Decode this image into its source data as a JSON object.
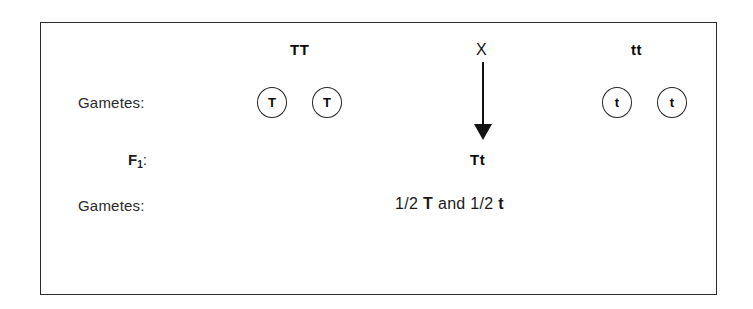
{
  "diagram": {
    "border_color": "#2b2b2b",
    "text_color": "#111111"
  },
  "rows": {
    "parents_label": "",
    "gametes_label_1": "Gametes:",
    "f1_label_f": "F",
    "f1_label_sub": "1",
    "f1_label_colon": ":",
    "gametes_label_2": "Gametes:"
  },
  "parents": {
    "left_genotype": "TT",
    "cross_symbol": "X",
    "right_genotype": "tt"
  },
  "gametes_parent_left": [
    {
      "allele": "T"
    },
    {
      "allele": "T"
    }
  ],
  "gametes_parent_right": [
    {
      "allele": "t"
    },
    {
      "allele": "t"
    }
  ],
  "offspring": {
    "f1_genotype": "Tt"
  },
  "f1_gametes": {
    "fraction_1": "1/2",
    "allele_1": "T",
    "conjunction": "and",
    "fraction_2": "1/2",
    "allele_2": "t"
  }
}
